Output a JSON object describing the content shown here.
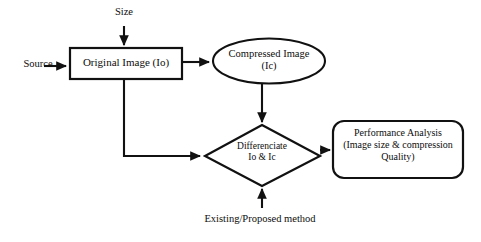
{
  "diagram": {
    "background_color": "#ffffff",
    "stroke_color": "#111111",
    "nodes": {
      "source": {
        "label": "Source",
        "shape": "text-label"
      },
      "size": {
        "label": "Size",
        "shape": "text-label"
      },
      "original_image": {
        "label": "Original Image (Io)",
        "shape": "rectangle"
      },
      "compressed_image": {
        "line1": "Compressed Image",
        "line2": "(Ic)",
        "shape": "ellipse"
      },
      "differenciate": {
        "line1": "Differenciate",
        "line2": "Io & Ic",
        "shape": "diamond"
      },
      "performance_analysis": {
        "line1": "Performance Analysis",
        "line2": "(Image size & compression",
        "line3": "Quality)",
        "shape": "rounded-rectangle"
      },
      "method": {
        "label": "Existing/Proposed method",
        "shape": "text-label"
      }
    },
    "edges": [
      {
        "from": "source",
        "to": "original_image",
        "direction": "right"
      },
      {
        "from": "size",
        "to": "original_image",
        "direction": "down"
      },
      {
        "from": "original_image",
        "to": "compressed_image",
        "direction": "right"
      },
      {
        "from": "original_image",
        "to": "differenciate",
        "direction": "down-right"
      },
      {
        "from": "compressed_image",
        "to": "differenciate",
        "direction": "down"
      },
      {
        "from": "method",
        "to": "differenciate",
        "direction": "up"
      },
      {
        "from": "differenciate",
        "to": "performance_analysis",
        "direction": "right"
      }
    ]
  }
}
